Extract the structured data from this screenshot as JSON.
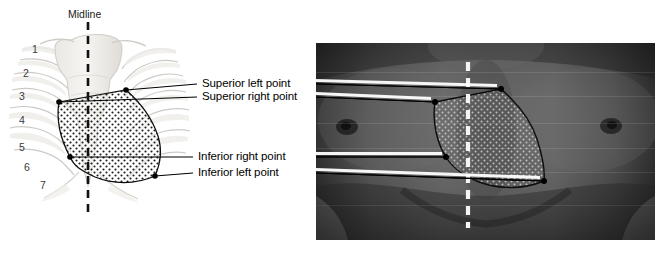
{
  "figure": {
    "background_color": "#ffffff"
  },
  "midline": {
    "label": "Midline",
    "style": "dashed-vertical",
    "left_panel_color": "#111111",
    "right_panel_color": "#ffffff"
  },
  "left_panel": {
    "name": "skeletal-line-drawing",
    "description": "Line drawing of sternum and ribs with stippled precordial region",
    "rib_numbers": [
      "1",
      "2",
      "3",
      "4",
      "5",
      "6",
      "7"
    ],
    "region_fill": "stippled",
    "region_outline_color": "#111111"
  },
  "right_panel": {
    "name": "chest-photograph",
    "description": "Grayscale photograph of male anterior chest with stippled region overlay",
    "overlay_outline_color": "#111111"
  },
  "labels": [
    {
      "id": "superior-left-point",
      "text": "Superior left point"
    },
    {
      "id": "superior-right-point",
      "text": "Superior right point"
    },
    {
      "id": "inferior-right-point",
      "text": "Inferior right point"
    },
    {
      "id": "inferior-left-point",
      "text": "Inferior left point"
    }
  ],
  "landmark_points": {
    "left_panel": {
      "superior_left": {
        "x": 126,
        "y": 90
      },
      "superior_right": {
        "x": 59,
        "y": 102
      },
      "inferior_right": {
        "x": 70,
        "y": 157
      },
      "inferior_left": {
        "x": 155,
        "y": 176
      }
    },
    "right_panel": {
      "superior_left": {
        "x": 501,
        "y": 89
      },
      "superior_right": {
        "x": 435,
        "y": 102
      },
      "inferior_right": {
        "x": 446,
        "y": 157
      },
      "inferior_left": {
        "x": 544,
        "y": 181
      }
    }
  }
}
